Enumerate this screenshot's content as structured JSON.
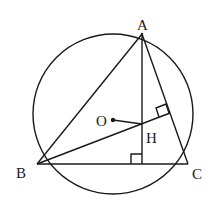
{
  "diagram": {
    "title": "",
    "stroke_color": "#1a1a1a",
    "background": "#ffffff",
    "circle": {
      "cx": 113,
      "cy": 115,
      "r": 81
    },
    "points": {
      "A": {
        "x": 142,
        "y": 34,
        "label": "A"
      },
      "B": {
        "x": 37,
        "y": 164,
        "label": "B"
      },
      "C": {
        "x": 188,
        "y": 164,
        "label": "C"
      },
      "H": {
        "x": 142,
        "y": 124,
        "label": "H"
      },
      "O": {
        "x": 112,
        "y": 120,
        "label": "O"
      }
    },
    "segments": [
      "AB",
      "BC",
      "CA",
      "AD(altitude from A)",
      "BE(altitude from B)",
      "OH"
    ],
    "right_angle_marks": [
      "foot of altitude from A on BC",
      "foot of altitude from B on AC"
    ]
  }
}
